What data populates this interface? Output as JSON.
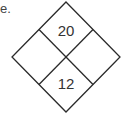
{
  "text_fragment": "e.",
  "diagram": {
    "type": "diamond-quadrants",
    "stroke_color": "#2a2a2a",
    "cells": {
      "top": "20",
      "left": "",
      "right": "",
      "bottom": "12"
    }
  }
}
